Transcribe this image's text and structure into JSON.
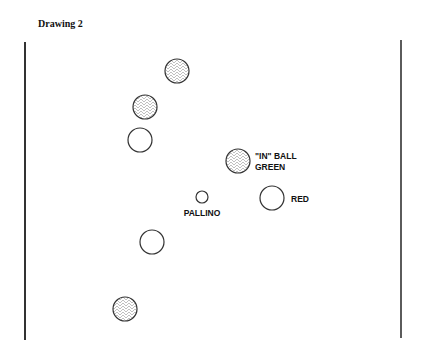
{
  "title": "Drawing 2",
  "colors": {
    "line": "#333333",
    "hatch": "#aaaaaa",
    "text": "#111111"
  },
  "court": {
    "left_wall": {
      "x": 25,
      "y1": 42,
      "y2": 340
    },
    "right_wall": {
      "x": 401,
      "y1": 40,
      "y2": 338
    }
  },
  "balls": [
    {
      "id": "ball-1",
      "cx": 177,
      "cy": 71,
      "r": 12,
      "fill": "hatched"
    },
    {
      "id": "ball-2",
      "cx": 145,
      "cy": 107,
      "r": 12,
      "fill": "hatched"
    },
    {
      "id": "ball-3",
      "cx": 140,
      "cy": 140,
      "r": 12,
      "fill": "plain"
    },
    {
      "id": "in-ball",
      "cx": 238,
      "cy": 161,
      "r": 12,
      "fill": "hatched"
    },
    {
      "id": "pallino",
      "cx": 202,
      "cy": 197,
      "r": 6,
      "fill": "plain"
    },
    {
      "id": "red-ball",
      "cx": 272,
      "cy": 198,
      "r": 12,
      "fill": "plain"
    },
    {
      "id": "ball-7",
      "cx": 152,
      "cy": 242,
      "r": 12,
      "fill": "plain"
    },
    {
      "id": "ball-8",
      "cx": 125,
      "cy": 309,
      "r": 12,
      "fill": "hatched"
    }
  ],
  "labels": {
    "in_ball_line1": "\"IN\" BALL",
    "in_ball_line2": "GREEN",
    "pallino": "PALLINO",
    "red": "RED"
  }
}
